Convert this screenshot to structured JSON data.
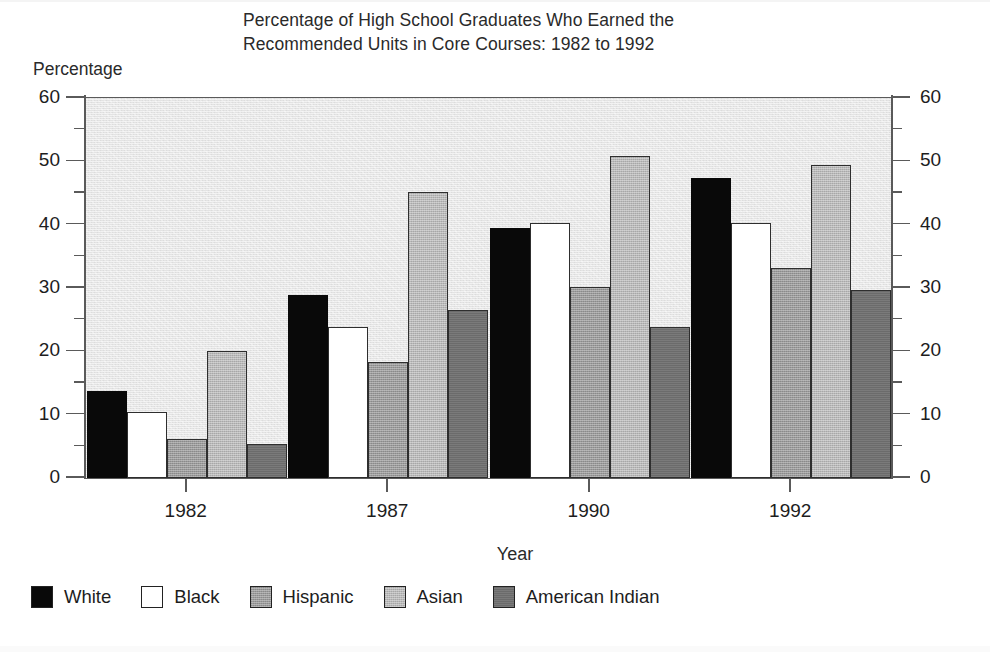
{
  "chart_data": {
    "type": "bar",
    "title": "Percentage of High School Graduates Who Earned the Recommended Units in Core Courses: 1982 to 1992",
    "title_line1": "Percentage of High School Graduates Who Earned the",
    "title_line2": "Recommended Units in Core Courses: 1982 to 1992",
    "xlabel": "Year",
    "ylabel": "Percentage",
    "categories": [
      "1982",
      "1987",
      "1990",
      "1992"
    ],
    "ylim": [
      0,
      60
    ],
    "ytick_labels": [
      "0",
      "10",
      "20",
      "30",
      "40",
      "50",
      "60"
    ],
    "ytick_values": [
      0,
      10,
      20,
      30,
      40,
      50,
      60
    ],
    "yminor_values": [
      5,
      15,
      25,
      35,
      45,
      55
    ],
    "grid": false,
    "legend_position": "bottom-left",
    "dual_axis": true,
    "series": [
      {
        "name": "White",
        "color": "#090909",
        "values": [
          13.8,
          28.9,
          39.4,
          47.3
        ]
      },
      {
        "name": "Black",
        "color": "#ffffff",
        "values": [
          10.4,
          23.8,
          40.2,
          40.3
        ]
      },
      {
        "name": "Hispanic",
        "color": "#9a9a9a",
        "values": [
          6.1,
          18.3,
          30.1,
          33.1
        ]
      },
      {
        "name": "Asian",
        "color": "#b8b8b8",
        "values": [
          20.1,
          45.2,
          50.8,
          49.5
        ]
      },
      {
        "name": "American Indian",
        "color": "#6b6b6b",
        "values": [
          5.4,
          26.6,
          23.9,
          29.7
        ]
      }
    ]
  },
  "legend": {
    "items": [
      {
        "label": "White",
        "swatch": "black-swatch"
      },
      {
        "label": "Black",
        "swatch": "white-swatch"
      },
      {
        "label": "Hispanic",
        "swatch": "medium-gray-swatch"
      },
      {
        "label": "Asian",
        "swatch": "light-gray-swatch"
      },
      {
        "label": "American Indian",
        "swatch": "dark-gray-swatch"
      }
    ]
  }
}
